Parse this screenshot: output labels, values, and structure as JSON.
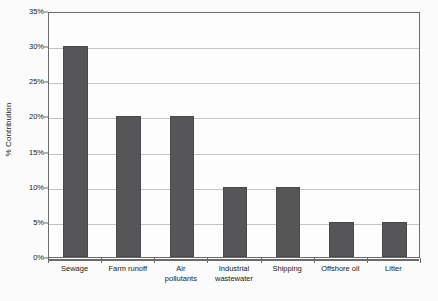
{
  "chart_data": {
    "type": "bar",
    "title": "",
    "xlabel": "",
    "ylabel": "% Contribution",
    "categories": [
      "Sewage",
      "Farm runoff",
      "Air\npollutants",
      "Industrial\nwastewater",
      "Shipping",
      "Offshore oil",
      "Litter"
    ],
    "values": [
      30,
      20,
      20,
      10,
      10,
      5,
      5
    ],
    "ylim": [
      0,
      35
    ],
    "ytick_values": [
      0,
      5,
      10,
      15,
      20,
      25,
      30,
      35
    ],
    "ytick_labels": [
      "0%",
      "5%",
      "10%",
      "15%",
      "20%",
      "25%",
      "30%",
      "35%"
    ],
    "grid": true,
    "legend": false,
    "series": [
      {
        "name": "% Contribution",
        "values": [
          30,
          20,
          20,
          10,
          10,
          5,
          5
        ]
      }
    ],
    "colors": {
      "bar": "#565658",
      "gridline": "#c4c4c4",
      "axis": "#6b6b6b",
      "background": "#fbfbfb",
      "plot_background": "#fdfdfd",
      "text": "#1a1a1a"
    }
  }
}
